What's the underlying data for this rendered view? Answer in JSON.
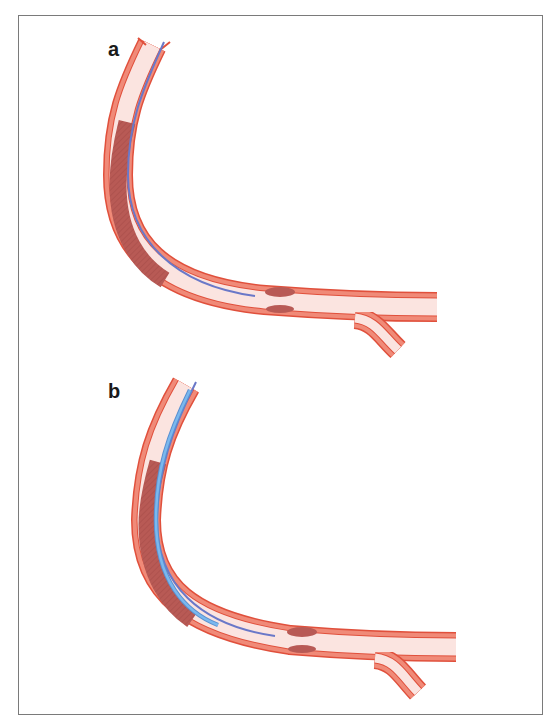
{
  "figure": {
    "panels": [
      {
        "label": "a",
        "description": "Vessel with long lesion; guidewire passed through occluded segment"
      },
      {
        "label": "b",
        "description": "Vessel with long lesion; catheter advanced over guidewire through lesion"
      }
    ]
  },
  "colors": {
    "vessel_wall": "#f08a78",
    "vessel_edge": "#e0503c",
    "lumen": "#fbe4e0",
    "plaque": "#b85a55",
    "guidewire": "#6a78c8",
    "catheter": "#6aaae8"
  }
}
